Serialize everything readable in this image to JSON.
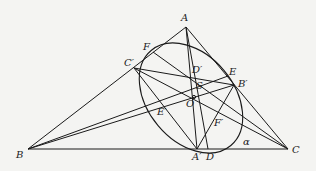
{
  "diagram": {
    "type": "geometry",
    "stroke_color": "#1a1a1a",
    "background": "#f4f4f2",
    "points": {
      "A": {
        "label": "A",
        "x": 186,
        "y": 27
      },
      "B": {
        "label": "B",
        "x": 28,
        "y": 149
      },
      "C": {
        "label": "C",
        "x": 288,
        "y": 149
      },
      "F": {
        "label": "F",
        "x": 153,
        "y": 52
      },
      "C1": {
        "label": "C′",
        "x": 134,
        "y": 68
      },
      "D1": {
        "label": "D′",
        "x": 191,
        "y": 70
      },
      "E": {
        "label": "E",
        "x": 228,
        "y": 76
      },
      "B1": {
        "label": "B′",
        "x": 234,
        "y": 85
      },
      "S": {
        "label": "S",
        "x": 193,
        "y": 88
      },
      "O": {
        "label": "O",
        "x": 194,
        "y": 97
      },
      "E1": {
        "label": "E′",
        "x": 166,
        "y": 107
      },
      "F1": {
        "label": "F′",
        "x": 221,
        "y": 117
      },
      "A1": {
        "label": "A′",
        "x": 197,
        "y": 149
      },
      "D": {
        "label": "D",
        "x": 208,
        "y": 149
      },
      "alpha": {
        "label": "α",
        "x": 246,
        "y": 143
      }
    },
    "segments": [
      [
        "A",
        "B"
      ],
      [
        "A",
        "C"
      ],
      [
        "B",
        "C"
      ],
      [
        "A",
        "A1"
      ],
      [
        "A",
        "D"
      ],
      [
        "C1",
        "B1"
      ],
      [
        "C1",
        "C"
      ],
      [
        "C1",
        "A1"
      ],
      [
        "F",
        "C"
      ],
      [
        "B",
        "B1"
      ],
      [
        "B",
        "E"
      ],
      [
        "B1",
        "A1"
      ]
    ],
    "ellipse": {
      "label": "α",
      "cx": 191,
      "cy": 98,
      "rx": 62,
      "ry": 43,
      "rotation_deg": 50
    }
  }
}
